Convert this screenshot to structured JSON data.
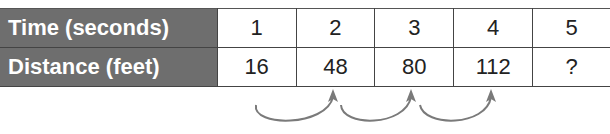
{
  "table": {
    "rows": [
      {
        "label": "Time (seconds)",
        "values": [
          "1",
          "2",
          "3",
          "4",
          "5"
        ]
      },
      {
        "label": "Distance (feet)",
        "values": [
          "16",
          "48",
          "80",
          "112",
          "?"
        ]
      }
    ]
  },
  "colors": {
    "header_bg": "#6e6e6e",
    "header_text": "#ffffff",
    "border": "#444444",
    "arrow": "#7a7a7a"
  },
  "arrows": [
    {
      "from_col": 1,
      "to_col": 2
    },
    {
      "from_col": 2,
      "to_col": 3
    },
    {
      "from_col": 3,
      "to_col": 4
    }
  ]
}
